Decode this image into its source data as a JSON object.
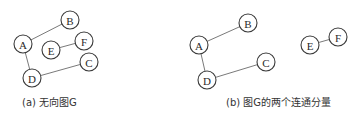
{
  "figures": [
    {
      "id": "a",
      "caption": "(a) 无向图G",
      "caption_pos": {
        "x": 22,
        "y": 97
      },
      "nodes": [
        {
          "id": "A",
          "label": "A",
          "x": 23,
          "y": 44
        },
        {
          "id": "B",
          "label": "B",
          "x": 70,
          "y": 20
        },
        {
          "id": "E",
          "label": "E",
          "x": 51,
          "y": 50
        },
        {
          "id": "F",
          "label": "F",
          "x": 84,
          "y": 41
        },
        {
          "id": "C",
          "label": "C",
          "x": 89,
          "y": 62
        },
        {
          "id": "D",
          "label": "D",
          "x": 32,
          "y": 78
        }
      ],
      "edges": [
        [
          "A",
          "B"
        ],
        [
          "A",
          "D"
        ],
        [
          "D",
          "C"
        ],
        [
          "E",
          "F"
        ]
      ]
    },
    {
      "id": "b",
      "caption": "(b) 图G的两个连通分量",
      "caption_pos": {
        "x": 226,
        "y": 97
      },
      "nodes": [
        {
          "id": "A",
          "label": "A",
          "x": 199,
          "y": 45
        },
        {
          "id": "B",
          "label": "B",
          "x": 248,
          "y": 23
        },
        {
          "id": "C",
          "label": "C",
          "x": 266,
          "y": 62
        },
        {
          "id": "D",
          "label": "D",
          "x": 207,
          "y": 80
        },
        {
          "id": "E",
          "label": "E",
          "x": 310,
          "y": 45
        },
        {
          "id": "F",
          "label": "F",
          "x": 338,
          "y": 37
        }
      ],
      "edges": [
        [
          "A",
          "B"
        ],
        [
          "A",
          "D"
        ],
        [
          "D",
          "C"
        ],
        [
          "E",
          "F"
        ]
      ]
    }
  ],
  "style": {
    "node_radius": 9,
    "edge_color": "#6a6a6a",
    "node_stroke": "#3a3a3a",
    "background": "#ffffff"
  }
}
